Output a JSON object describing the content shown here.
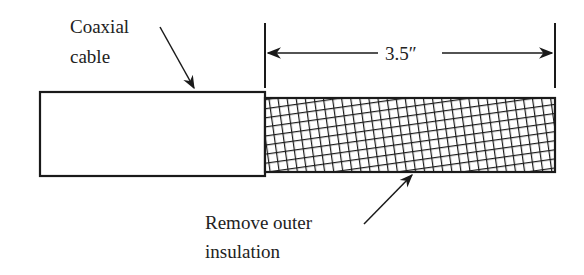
{
  "labels": {
    "coaxial_line1": "Coaxial",
    "coaxial_line2": "cable",
    "dimension": "3.5″",
    "remove_line1": "Remove outer",
    "remove_line2": "insulation"
  },
  "colors": {
    "stroke": "#1a1a1a",
    "background": "#ffffff"
  }
}
